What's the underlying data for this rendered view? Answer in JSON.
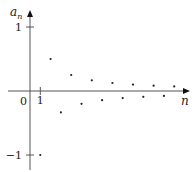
{
  "chart_data": {
    "type": "scatter",
    "title": "",
    "xlabel": "n",
    "ylabel": "a",
    "ylabel_subscript": "n",
    "origin_label": "0",
    "x_ticks": [
      {
        "value": 1,
        "label": "1"
      }
    ],
    "y_ticks": [
      {
        "value": 1,
        "label": "1"
      },
      {
        "value": -1,
        "label": "−1"
      }
    ],
    "xlim": [
      -1.1,
      13.9
    ],
    "ylim": [
      -1.25,
      1.4
    ],
    "grid": false,
    "series": [
      {
        "name": "a_n = (-1)^n / n",
        "x": [
          1,
          2,
          3,
          4,
          5,
          6,
          7,
          8,
          9,
          10,
          11,
          12,
          13,
          14
        ],
        "y": [
          -1,
          0.5,
          -0.333,
          0.25,
          -0.2,
          0.167,
          -0.143,
          0.125,
          -0.111,
          0.1,
          -0.091,
          0.083,
          -0.077,
          0.071
        ]
      }
    ],
    "colors": {
      "axis": "#555555",
      "point": "#222222"
    }
  }
}
